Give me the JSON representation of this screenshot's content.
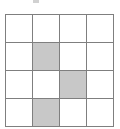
{
  "figure": {
    "name": "grid-pattern",
    "rows": 4,
    "columns": 4,
    "cell_width_px": 26,
    "cell_height_px": 27,
    "colors": {
      "background": "#ffffff",
      "grid_line": "#7f7f7f",
      "shaded_cell": "#c8c8c8",
      "empty_cell": "#ffffff"
    },
    "shaded_cells": [
      {
        "row": 2,
        "column": 2
      },
      {
        "row": 3,
        "column": 3
      },
      {
        "row": 4,
        "column": 2
      }
    ],
    "grid": [
      [
        "empty",
        "empty",
        "empty",
        "empty"
      ],
      [
        "empty",
        "shaded",
        "empty",
        "empty"
      ],
      [
        "empty",
        "empty",
        "shaded",
        "empty"
      ],
      [
        "empty",
        "shaded",
        "empty",
        "empty"
      ]
    ],
    "cell_labels": [
      [
        "",
        "",
        "",
        ""
      ],
      [
        "",
        "",
        "",
        ""
      ],
      [
        "",
        "",
        "",
        ""
      ],
      [
        "",
        "",
        "",
        ""
      ]
    ]
  },
  "artifact": {
    "top_mark": ""
  }
}
